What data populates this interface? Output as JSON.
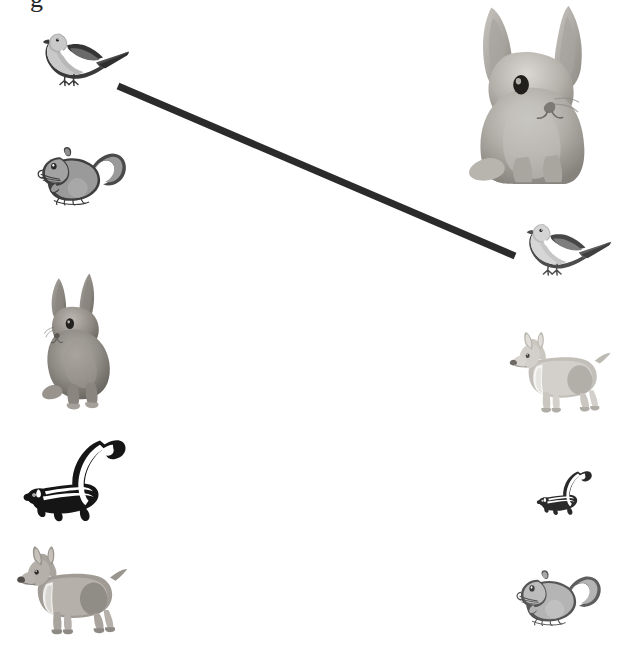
{
  "canvas": {
    "width": 624,
    "height": 661,
    "background_color": "#ffffff",
    "description": "Grayscale scanned page showing animal clip-art images arranged in two columns with a single thick dark line connecting the top-left pigeon to the middle-right pigeon."
  },
  "clipped_text": {
    "visible_fragment": "g",
    "note": "bottom of a single glyph cut off at the top edge of the page"
  },
  "connector": {
    "name": "matching-line",
    "color": "#2b2b2b",
    "stroke_width": 7,
    "from_label": "pigeon-left",
    "to_label": "pigeon-right",
    "x1": 118,
    "y1": 86,
    "x2": 515,
    "y2": 256
  },
  "animals": [
    {
      "id": "pigeon-left",
      "label": "pigeon",
      "column": "left",
      "x": 30,
      "y": 22,
      "width": 100,
      "height": 76,
      "tone": "dark"
    },
    {
      "id": "squirrel-left",
      "label": "squirrel",
      "column": "left",
      "x": 28,
      "y": 133,
      "width": 102,
      "height": 78,
      "tone": "dark"
    },
    {
      "id": "rabbit-left",
      "label": "rabbit",
      "column": "left",
      "x": 32,
      "y": 270,
      "width": 96,
      "height": 140,
      "tone": "dark"
    },
    {
      "id": "skunk-left",
      "label": "skunk",
      "column": "left",
      "x": 22,
      "y": 427,
      "width": 104,
      "height": 96,
      "tone": "dark"
    },
    {
      "id": "dog-left",
      "label": "dog",
      "column": "left",
      "x": 14,
      "y": 544,
      "width": 116,
      "height": 92,
      "tone": "dark"
    },
    {
      "id": "rabbit-right",
      "label": "rabbit",
      "column": "right",
      "x": 461,
      "y": 4,
      "width": 150,
      "height": 180,
      "tone": "light"
    },
    {
      "id": "pigeon-right",
      "label": "pigeon",
      "column": "right",
      "x": 514,
      "y": 212,
      "width": 98,
      "height": 76,
      "tone": "light"
    },
    {
      "id": "dog-right",
      "label": "dog",
      "column": "right",
      "x": 506,
      "y": 330,
      "width": 108,
      "height": 84,
      "tone": "light"
    },
    {
      "id": "skunk-right",
      "label": "skunk",
      "column": "right",
      "x": 536,
      "y": 464,
      "width": 56,
      "height": 52,
      "tone": "light"
    },
    {
      "id": "squirrel-right",
      "label": "squirrel",
      "column": "right",
      "x": 508,
      "y": 556,
      "width": 96,
      "height": 76,
      "tone": "light"
    }
  ],
  "palette": {
    "ink": "#2b2b2b",
    "fur_mid": "#9a9a9a",
    "fur_light": "#c2c2c2",
    "fur_dark": "#6e6e6e",
    "outline": "#3a3a3a",
    "white": "#ffffff"
  }
}
